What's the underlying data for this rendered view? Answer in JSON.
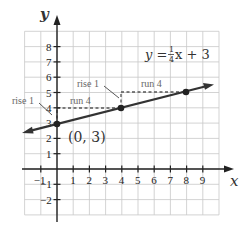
{
  "chart_data": {
    "type": "line",
    "title": "",
    "equation": {
      "lhs": "y",
      "eq": "=",
      "num": "1",
      "den": "4",
      "rest": "x + 3"
    },
    "xlabel": "x",
    "ylabel": "y",
    "xlim": [
      -2,
      10
    ],
    "ylim": [
      -3,
      9
    ],
    "grid": true,
    "x_ticks": [
      "-1",
      "1",
      "2",
      "3",
      "4",
      "5",
      "6",
      "7",
      "8",
      "9"
    ],
    "y_ticks": [
      "8",
      "7",
      "6",
      "5",
      "4",
      "3",
      "2",
      "1",
      "-1",
      "-2"
    ],
    "series": [
      {
        "name": "y = 1/4 x + 3",
        "slope": 0.25,
        "intercept": 3,
        "x": [
          -1.9,
          9.7
        ],
        "y": [
          2.525,
          5.425
        ]
      }
    ],
    "points": [
      {
        "x": 0,
        "y": 3,
        "label": "(0, 3)"
      },
      {
        "x": 4,
        "y": 4,
        "label": ""
      },
      {
        "x": 8,
        "y": 5,
        "label": ""
      }
    ],
    "annotations": [
      {
        "text": "rise 1",
        "near": [
          0,
          3.5
        ]
      },
      {
        "text": "run 4",
        "near": [
          2,
          4
        ]
      },
      {
        "text": "rise 1",
        "near": [
          4,
          4.5
        ]
      },
      {
        "text": "run 4",
        "near": [
          6,
          5
        ]
      }
    ]
  },
  "labels": {
    "x_axis": "x",
    "y_axis": "y",
    "point_label": "(0, 3)",
    "rise1_left": "rise 1",
    "run4_left": "run 4",
    "rise1_right": "rise 1",
    "run4_right": "run 4",
    "eq_lhs": "y =",
    "eq_num": "1",
    "eq_den": "4",
    "eq_rest": "x + 3"
  }
}
